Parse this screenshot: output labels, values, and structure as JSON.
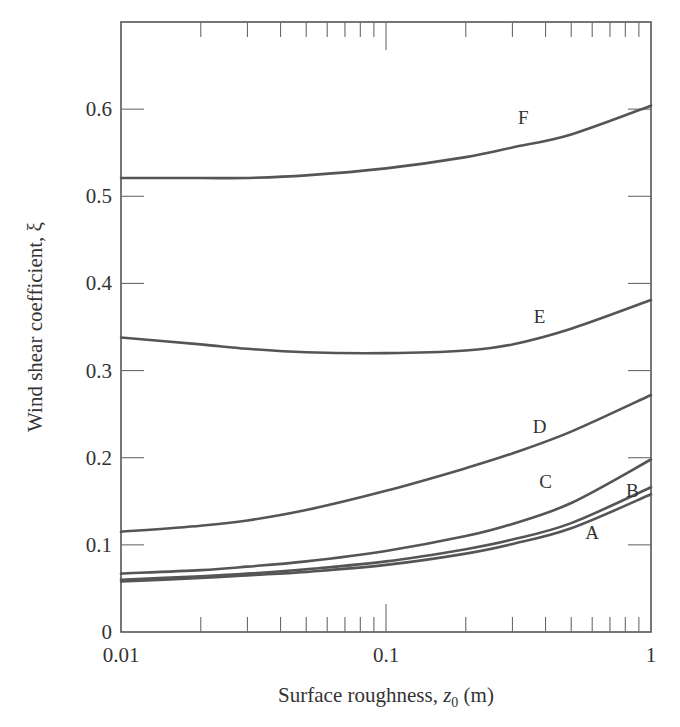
{
  "chart_data": {
    "type": "line",
    "title": "",
    "xlabel": "Surface roughness, z0 (m)",
    "xlabel_parts": {
      "main": "Surface roughness, ",
      "var": "z",
      "sub": "0",
      "unit": " (m)"
    },
    "ylabel": "Wind shear coefficient, ξ",
    "xscale": "log",
    "xlim": [
      0.01,
      1
    ],
    "ylim": [
      0,
      0.7
    ],
    "grid": false,
    "legend": "inline curve labels",
    "x_ticks": [
      {
        "value": 0.01,
        "label": "0.01"
      },
      {
        "value": 0.1,
        "label": "0.1"
      },
      {
        "value": 1,
        "label": "1"
      }
    ],
    "y_ticks": [
      {
        "value": 0,
        "label": "0"
      },
      {
        "value": 0.1,
        "label": "0.1"
      },
      {
        "value": 0.2,
        "label": "0.2"
      },
      {
        "value": 0.3,
        "label": "0.3"
      },
      {
        "value": 0.4,
        "label": "0.4"
      },
      {
        "value": 0.5,
        "label": "0.5"
      },
      {
        "value": 0.6,
        "label": "0.6"
      }
    ],
    "x": [
      0.01,
      0.02,
      0.03,
      0.05,
      0.1,
      0.2,
      0.3,
      0.5,
      1
    ],
    "series": [
      {
        "name": "A",
        "values": [
          0.058,
          0.062,
          0.065,
          0.069,
          0.077,
          0.09,
          0.101,
          0.119,
          0.158
        ],
        "label_at": {
          "x": 0.6,
          "y": 0.107
        }
      },
      {
        "name": "B",
        "values": [
          0.06,
          0.064,
          0.067,
          0.072,
          0.081,
          0.095,
          0.106,
          0.125,
          0.166
        ],
        "label_at": {
          "x": 0.85,
          "y": 0.155
        }
      },
      {
        "name": "C",
        "values": [
          0.067,
          0.071,
          0.075,
          0.081,
          0.093,
          0.11,
          0.124,
          0.148,
          0.198
        ],
        "label_at": {
          "x": 0.4,
          "y": 0.165
        }
      },
      {
        "name": "D",
        "values": [
          0.115,
          0.122,
          0.128,
          0.14,
          0.162,
          0.188,
          0.205,
          0.23,
          0.272
        ],
        "label_at": {
          "x": 0.38,
          "y": 0.228
        }
      },
      {
        "name": "E",
        "values": [
          0.338,
          0.33,
          0.325,
          0.321,
          0.32,
          0.323,
          0.33,
          0.348,
          0.381
        ],
        "label_at": {
          "x": 0.38,
          "y": 0.355
        }
      },
      {
        "name": "F",
        "values": [
          0.521,
          0.521,
          0.521,
          0.524,
          0.532,
          0.545,
          0.556,
          0.571,
          0.604
        ],
        "label_at": {
          "x": 0.33,
          "y": 0.583
        }
      }
    ]
  }
}
